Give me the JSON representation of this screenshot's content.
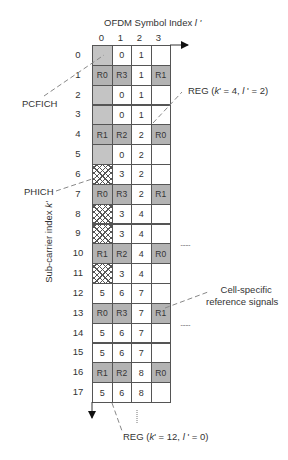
{
  "diagram": {
    "x_axis_title": "OFDM Symbol Index ",
    "x_axis_symbol": "l '",
    "y_axis_title": "Sub-carrier index ",
    "y_axis_symbol": "k'",
    "columns": [
      "0",
      "1",
      "2",
      "3"
    ],
    "rows": [
      "0",
      "1",
      "2",
      "3",
      "4",
      "5",
      "6",
      "7",
      "8",
      "9",
      "10",
      "11",
      "12",
      "13",
      "14",
      "15",
      "16",
      "17"
    ],
    "cells": [
      [
        {
          "t": "",
          "type": "pcfich"
        },
        {
          "t": "0",
          "type": "reg"
        },
        {
          "t": "1",
          "type": "reg"
        },
        {
          "t": "",
          "type": "empty"
        }
      ],
      [
        {
          "t": "R0",
          "type": "rs"
        },
        {
          "t": "R3",
          "type": "rs"
        },
        {
          "t": "1",
          "type": "reg"
        },
        {
          "t": "R1",
          "type": "rs"
        }
      ],
      [
        {
          "t": "",
          "type": "pcfich"
        },
        {
          "t": "0",
          "type": "reg"
        },
        {
          "t": "1",
          "type": "reg"
        },
        {
          "t": "",
          "type": "empty"
        }
      ],
      [
        {
          "t": "",
          "type": "pcfich"
        },
        {
          "t": "0",
          "type": "reg"
        },
        {
          "t": "1",
          "type": "reg"
        },
        {
          "t": "",
          "type": "empty"
        }
      ],
      [
        {
          "t": "R1",
          "type": "rs"
        },
        {
          "t": "R2",
          "type": "rs"
        },
        {
          "t": "2",
          "type": "reg"
        },
        {
          "t": "R0",
          "type": "rs"
        }
      ],
      [
        {
          "t": "",
          "type": "pcfich"
        },
        {
          "t": "0",
          "type": "reg"
        },
        {
          "t": "2",
          "type": "reg"
        },
        {
          "t": "",
          "type": "empty"
        }
      ],
      [
        {
          "t": "",
          "type": "phich"
        },
        {
          "t": "3",
          "type": "reg"
        },
        {
          "t": "2",
          "type": "reg"
        },
        {
          "t": "",
          "type": "empty"
        }
      ],
      [
        {
          "t": "R0",
          "type": "rs"
        },
        {
          "t": "R3",
          "type": "rs"
        },
        {
          "t": "2",
          "type": "reg"
        },
        {
          "t": "R1",
          "type": "rs"
        }
      ],
      [
        {
          "t": "",
          "type": "phich"
        },
        {
          "t": "3",
          "type": "reg"
        },
        {
          "t": "4",
          "type": "reg"
        },
        {
          "t": "",
          "type": "empty"
        }
      ],
      [
        {
          "t": "",
          "type": "phich"
        },
        {
          "t": "3",
          "type": "reg"
        },
        {
          "t": "4",
          "type": "reg"
        },
        {
          "t": "",
          "type": "empty"
        }
      ],
      [
        {
          "t": "R1",
          "type": "rs"
        },
        {
          "t": "R2",
          "type": "rs"
        },
        {
          "t": "4",
          "type": "reg"
        },
        {
          "t": "R0",
          "type": "rs"
        }
      ],
      [
        {
          "t": "",
          "type": "phich"
        },
        {
          "t": "3",
          "type": "reg"
        },
        {
          "t": "4",
          "type": "reg"
        },
        {
          "t": "",
          "type": "empty"
        }
      ],
      [
        {
          "t": "5",
          "type": "reg"
        },
        {
          "t": "6",
          "type": "reg"
        },
        {
          "t": "7",
          "type": "reg"
        },
        {
          "t": "",
          "type": "empty"
        }
      ],
      [
        {
          "t": "R0",
          "type": "rs"
        },
        {
          "t": "R3",
          "type": "rs"
        },
        {
          "t": "7",
          "type": "reg"
        },
        {
          "t": "R1",
          "type": "rs"
        }
      ],
      [
        {
          "t": "5",
          "type": "reg"
        },
        {
          "t": "6",
          "type": "reg"
        },
        {
          "t": "7",
          "type": "reg"
        },
        {
          "t": "",
          "type": "empty"
        }
      ],
      [
        {
          "t": "5",
          "type": "reg"
        },
        {
          "t": "6",
          "type": "reg"
        },
        {
          "t": "7",
          "type": "reg"
        },
        {
          "t": "",
          "type": "empty"
        }
      ],
      [
        {
          "t": "R1",
          "type": "rs"
        },
        {
          "t": "R2",
          "type": "rs"
        },
        {
          "t": "8",
          "type": "reg"
        },
        {
          "t": "R0",
          "type": "rs"
        }
      ],
      [
        {
          "t": "5",
          "type": "reg"
        },
        {
          "t": "6",
          "type": "reg"
        },
        {
          "t": "8",
          "type": "reg"
        },
        {
          "t": "",
          "type": "empty"
        }
      ]
    ],
    "annotations": {
      "pcfich": "PCFICH",
      "phich": "PHICH",
      "reg_top": "REG (k' = 4, l ' = 2)",
      "reg_bottom": "REG (k' = 12, l ' = 0)",
      "cell_rs_line1": "Cell-specific",
      "cell_rs_line2": "reference signals",
      "ellipsis_1": "......",
      "ellipsis_2": "......"
    },
    "colors": {
      "grid_line": "#555555",
      "pcfich_fill": "#c4c4c4",
      "rs_fill": "#d6d6d6",
      "text": "#333333"
    }
  }
}
